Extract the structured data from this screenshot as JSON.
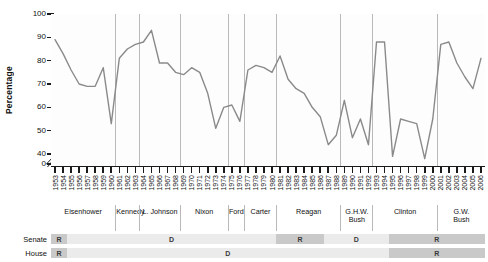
{
  "chart_data": {
    "type": "line",
    "title": "",
    "xlabel": "",
    "ylabel": "Percentage",
    "ylim": [
      40,
      100
    ],
    "y_axis_break": true,
    "y_zero_shown": true,
    "ytick_labels": [
      "100",
      "90",
      "80",
      "70",
      "60",
      "50",
      "40",
      "0"
    ],
    "ytick_values": [
      100,
      90,
      80,
      70,
      60,
      50,
      40,
      0
    ],
    "grid": false,
    "vertical_separators_at_years": [
      1961,
      1964,
      1969,
      1975,
      1977,
      1981,
      1989,
      1993,
      2001
    ],
    "series_name": "Presidential support score",
    "line_color": "#8a8a8a",
    "x": [
      1953,
      1954,
      1955,
      1956,
      1957,
      1958,
      1959,
      1960,
      1961,
      1962,
      1963,
      1964,
      1965,
      1966,
      1967,
      1968,
      1969,
      1970,
      1971,
      1972,
      1973,
      1974,
      1975,
      1976,
      1977,
      1978,
      1979,
      1980,
      1981,
      1982,
      1983,
      1984,
      1985,
      1986,
      1987,
      1988,
      1989,
      1990,
      1991,
      1992,
      1993,
      1994,
      1995,
      1996,
      1997,
      1998,
      1999,
      2000,
      2001,
      2002,
      2003,
      2004,
      2005,
      2006
    ],
    "values": [
      89,
      83,
      76,
      70,
      69,
      69,
      77,
      53,
      81,
      85,
      87,
      88,
      93,
      79,
      79,
      75,
      74,
      77,
      75,
      66,
      51,
      60,
      61,
      54,
      76,
      78,
      77,
      75,
      82,
      72,
      68,
      66,
      60,
      56,
      44,
      48,
      63,
      47,
      55,
      44,
      88,
      88,
      39,
      55,
      54,
      53,
      38,
      55,
      87,
      88,
      79,
      73,
      68,
      81
    ],
    "xtick_labels": [
      "1953",
      "1954",
      "1955",
      "1956",
      "1957",
      "1958",
      "1959",
      "1960",
      "1961",
      "1962",
      "1963",
      "1964",
      "1965",
      "1966",
      "1967",
      "1968",
      "1969",
      "1970",
      "1971",
      "1972",
      "1973",
      "1974",
      "1975",
      "1976",
      "1977",
      "1978",
      "1979",
      "1980",
      "1981",
      "1982",
      "1983",
      "1984",
      "1985",
      "1986",
      "1987",
      "1988",
      "1989",
      "1990",
      "1991",
      "1992",
      "1993",
      "1994",
      "1995",
      "1996",
      "1997",
      "1998",
      "1999",
      "2000",
      "2001",
      "2002",
      "2003",
      "2004",
      "2005",
      "2006"
    ]
  },
  "presidents": [
    {
      "name": "Eisenhower",
      "start": 1953,
      "end": 1960
    },
    {
      "name": "Kennedy",
      "start": 1961,
      "end": 1963
    },
    {
      "name": "L. Johnson",
      "start": 1964,
      "end": 1968
    },
    {
      "name": "Nixon",
      "start": 1969,
      "end": 1974
    },
    {
      "name": "Ford",
      "start": 1975,
      "end": 1976
    },
    {
      "name": "Carter",
      "start": 1977,
      "end": 1980
    },
    {
      "name": "Reagan",
      "start": 1981,
      "end": 1988
    },
    {
      "name": "G.H.W.\nBush",
      "start": 1989,
      "end": 1992
    },
    {
      "name": "Clinton",
      "start": 1993,
      "end": 2000
    },
    {
      "name": "G.W.\nBush",
      "start": 2001,
      "end": 2006
    }
  ],
  "congress": {
    "senate_label": "Senate",
    "house_label": "House",
    "senate": [
      {
        "party": "R",
        "start": 1953,
        "end": 1954
      },
      {
        "party": "D",
        "start": 1955,
        "end": 1980
      },
      {
        "party": "R",
        "start": 1981,
        "end": 1986
      },
      {
        "party": "D",
        "start": 1987,
        "end": 1994
      },
      {
        "party": "R",
        "start": 1995,
        "end": 2006
      }
    ],
    "house": [
      {
        "party": "R",
        "start": 1953,
        "end": 1954
      },
      {
        "party": "D",
        "start": 1955,
        "end": 1994
      },
      {
        "party": "R",
        "start": 1995,
        "end": 2006
      }
    ]
  }
}
